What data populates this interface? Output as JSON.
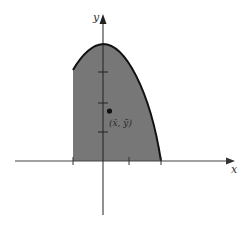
{
  "diagram": {
    "title": "",
    "axes": {
      "x_label": "x",
      "y_label": "y"
    },
    "region": {
      "description": "Shaded planar region bounded by a vertical line on the left, a concave-down curve on top, and the x-axis below",
      "fill_color": "#777777",
      "outline_color": "#111111"
    },
    "centroid": {
      "label": "(x̄, ȳ)",
      "color": "#111111"
    },
    "x_ticks_count": 3,
    "y_ticks_count": 3,
    "colors": {
      "background": "#ffffff",
      "axis": "#444444",
      "shade": "#777777",
      "curve": "#111111"
    }
  }
}
